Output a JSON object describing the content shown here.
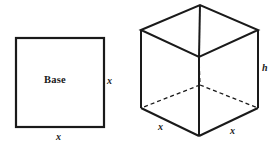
{
  "figure": {
    "background_color": "#ffffff",
    "stroke_color": "#1a1a1a",
    "width": 276,
    "height": 149,
    "square": {
      "name": "base-square",
      "center_label": "Base",
      "right_side_label": "x",
      "bottom_side_label": "x",
      "geometry": {
        "left": 16,
        "top": 38,
        "right": 104,
        "bottom": 127,
        "stroke_width": 2.2
      }
    },
    "cube": {
      "name": "open-box-cube",
      "height_label": "h",
      "front_left_edge_label": "x",
      "front_right_edge_label": "x",
      "geometry": {
        "top_back": [
          200,
          5
        ],
        "top_left": [
          141,
          30
        ],
        "top_right": [
          258,
          30
        ],
        "top_front_inner": [
          199,
          57
        ],
        "bottom_left": [
          141,
          108
        ],
        "bottom_right": [
          258,
          108
        ],
        "bottom_front": [
          199,
          136
        ],
        "bottom_back_hidden": [
          200,
          85
        ],
        "stroke_width": 2.0,
        "hidden_stroke_width": 1.3,
        "hidden_dash": "4,3"
      }
    }
  }
}
